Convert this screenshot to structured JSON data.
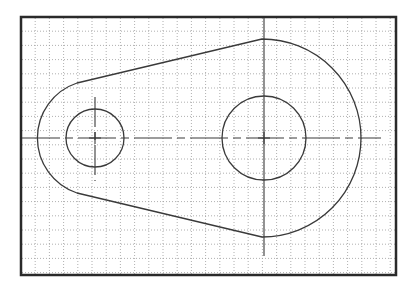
{
  "canvas": {
    "width": 412,
    "height": 290,
    "background": "#ffffff"
  },
  "frame": {
    "x": 21,
    "y": 17,
    "width": 375,
    "height": 258,
    "stroke": "#2a2a2a",
    "stroke_width": 2.5
  },
  "grid": {
    "spacing": 14.2,
    "origin_x": 21,
    "origin_y": 17,
    "color": "#9a9a9a",
    "dash": "1 2",
    "stroke_width": 0.8
  },
  "part": {
    "stroke": "#3a3a3a",
    "stroke_width": 1.3,
    "small_end": {
      "cx": 95,
      "cy": 138,
      "outer_r": 58,
      "hole_r": 29
    },
    "large_end": {
      "cx": 264,
      "cy": 138,
      "outer_r": 99,
      "hole_r": 42
    },
    "upper_tangent": {
      "x1": 77,
      "y1": 83,
      "x2": 262,
      "y2": 39
    },
    "lower_tangent": {
      "x1": 77,
      "y1": 193,
      "x2": 262,
      "y2": 237
    }
  },
  "centerlines": {
    "stroke": "#3a3a3a",
    "stroke_width": 1.1,
    "horizontal": {
      "y": 138,
      "x1": 22,
      "x2": 381,
      "dash": "38 5 8 5"
    },
    "small_vertical": {
      "x": 95,
      "y1": 97,
      "y2": 181,
      "dash": "30 5 8 5"
    },
    "large_vertical": {
      "x": 264,
      "y1": 18,
      "y2": 256,
      "dash": "none"
    }
  },
  "center_marks": [
    {
      "name": "small-hole-center",
      "cx": 95,
      "cy": 138,
      "size": 6
    },
    {
      "name": "large-hole-center",
      "cx": 264,
      "cy": 138,
      "size": 6
    }
  ]
}
